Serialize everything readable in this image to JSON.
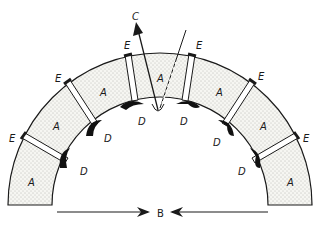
{
  "diagram": {
    "labels": {
      "block": "A",
      "center_force": "B",
      "escape": "C",
      "pad": "D",
      "joint": "E"
    },
    "blocks": [
      {
        "label": "A"
      },
      {
        "label": "A"
      },
      {
        "label": "A"
      },
      {
        "label": "A"
      },
      {
        "label": "A"
      },
      {
        "label": "A"
      },
      {
        "label": "A"
      }
    ],
    "joints": [
      {
        "label": "E"
      },
      {
        "label": "E"
      },
      {
        "label": "E"
      },
      {
        "label": "E"
      },
      {
        "label": "E"
      },
      {
        "label": "E"
      }
    ],
    "pads": [
      {
        "label": "D"
      },
      {
        "label": "D"
      },
      {
        "label": "D"
      },
      {
        "label": "D"
      },
      {
        "label": "D"
      },
      {
        "label": "D"
      }
    ],
    "colors": {
      "ink": "#1a1a1a",
      "fill": "#f4f4f0",
      "dots": "#7a7a7a"
    }
  }
}
